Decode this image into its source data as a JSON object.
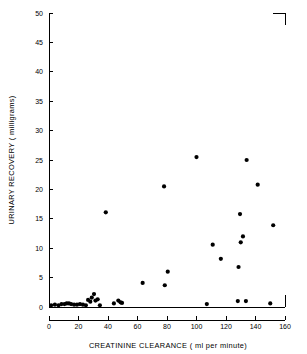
{
  "chart_data": {
    "type": "scatter",
    "title": "",
    "xlabel": "CREATININE  CLEARANCE ( ml per minute)",
    "ylabel": "URINARY  RECOVERY  ( milligrams)",
    "xlim": [
      0,
      160
    ],
    "ylim": [
      0,
      50
    ],
    "xticks": [
      0,
      20,
      40,
      60,
      80,
      100,
      120,
      140,
      160
    ],
    "xtick_labels": [
      "0",
      "20",
      "40",
      "60",
      "80",
      "100",
      "120",
      "140",
      "160"
    ],
    "yticks": [
      0,
      5,
      10,
      15,
      20,
      25,
      30,
      35,
      40,
      45,
      50
    ],
    "ytick_labels": [
      "0",
      "5",
      "10",
      "15",
      "20",
      "25",
      "30",
      "35",
      "40",
      "45",
      "50"
    ],
    "grid": false,
    "legend": null,
    "marker": "filled-circle",
    "marker_color": "#000000",
    "series": [
      {
        "name": "patients",
        "points": [
          [
            1.5,
            0.3
          ],
          [
            4.0,
            0.4
          ],
          [
            6.5,
            0.3
          ],
          [
            8.5,
            0.5
          ],
          [
            10.5,
            0.5
          ],
          [
            12.0,
            0.6
          ],
          [
            13.5,
            0.6
          ],
          [
            15.0,
            0.5
          ],
          [
            17.0,
            0.4
          ],
          [
            19.0,
            0.4
          ],
          [
            21.0,
            0.5
          ],
          [
            23.0,
            0.4
          ],
          [
            25.0,
            0.3
          ],
          [
            26.5,
            1.2
          ],
          [
            28.0,
            0.9
          ],
          [
            29.0,
            1.6
          ],
          [
            30.5,
            2.2
          ],
          [
            31.5,
            1.1
          ],
          [
            33.0,
            1.3
          ],
          [
            34.5,
            0.3
          ],
          [
            38.5,
            16.1
          ],
          [
            44.0,
            0.6
          ],
          [
            47.0,
            1.1
          ],
          [
            48.5,
            0.8
          ],
          [
            49.5,
            0.7
          ],
          [
            63.5,
            4.1
          ],
          [
            78.5,
            3.7
          ],
          [
            78.0,
            20.5
          ],
          [
            80.5,
            6.0
          ],
          [
            100.0,
            25.5
          ],
          [
            107.0,
            0.5
          ],
          [
            111.0,
            10.6
          ],
          [
            116.5,
            8.2
          ],
          [
            128.0,
            1.0
          ],
          [
            128.5,
            6.8
          ],
          [
            129.5,
            15.8
          ],
          [
            130.0,
            11.0
          ],
          [
            131.5,
            12.0
          ],
          [
            133.5,
            1.0
          ],
          [
            134.0,
            25.0
          ],
          [
            141.5,
            20.8
          ],
          [
            150.0,
            0.6
          ],
          [
            152.0,
            13.9
          ]
        ]
      }
    ]
  }
}
